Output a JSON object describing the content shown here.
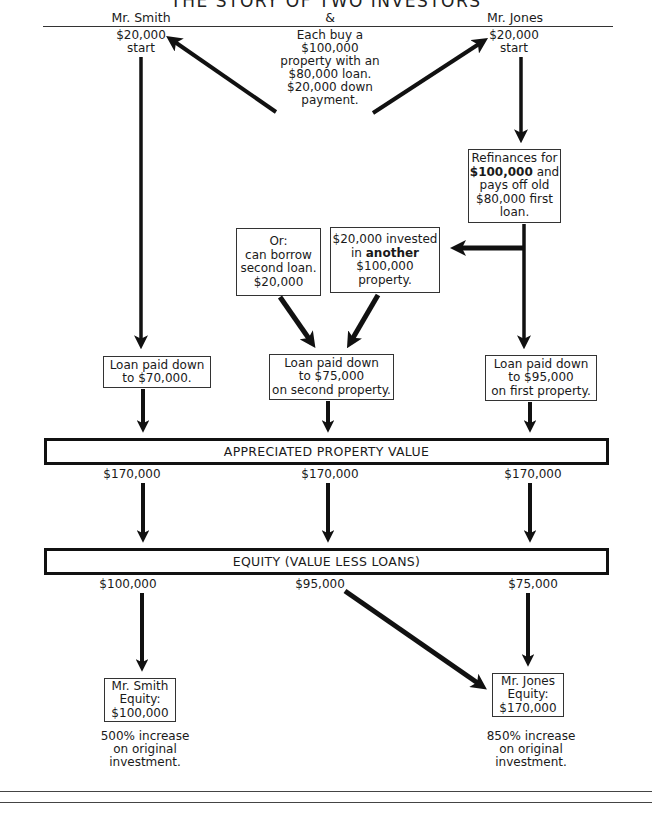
{
  "title": "THE STORY OF TWO INVESTORS",
  "header": {
    "left": "Mr. Smith",
    "middle": "&",
    "right": "Mr. Jones"
  },
  "smith": {
    "start_amount": "$20,000",
    "start_label": "start",
    "loan_box": [
      "Loan paid down",
      "to $70,000."
    ],
    "appreciated_value": "$170,000",
    "equity_value": "$100,000",
    "final_box": [
      "Mr. Smith",
      "Equity:",
      "$100,000"
    ],
    "increase_text": [
      "500% increase",
      "on original",
      "investment."
    ]
  },
  "middle": {
    "intro": [
      "Each buy a",
      "$100,000",
      "property with an",
      "$80,000 loan.",
      "$20,000 down",
      "payment."
    ],
    "borrow_box": [
      "Or:",
      "can borrow",
      "second loan.",
      "$20,000"
    ],
    "invested_box": {
      "line1": "$20,000 invested",
      "line2_prefix": "in ",
      "line2_bold": "another",
      "line3": "$100,000",
      "line4": "property."
    },
    "loan_box": [
      "Loan paid down",
      "to $75,000",
      "on second property."
    ],
    "appreciated_value": "$170,000",
    "equity_value": "$95,000"
  },
  "jones": {
    "start_amount": "$20,000",
    "start_label": "start",
    "refinance_box": {
      "line1": "Refinances for",
      "line2_bold": "$100,000",
      "line2_suffix": " and",
      "line3": "pays off old",
      "line4": "$80,000 first",
      "line5": "loan."
    },
    "loan_box": [
      "Loan paid down",
      "to $95,000",
      "on first property."
    ],
    "appreciated_value": "$170,000",
    "equity_value": "$75,000",
    "final_box": [
      "Mr. Jones",
      "Equity:",
      "$170,000"
    ],
    "increase_text": [
      "850% increase",
      "on original",
      "investment."
    ]
  },
  "bars": {
    "appreciated": "APPRECIATED PROPERTY VALUE",
    "equity": "EQUITY (VALUE LESS LOANS)"
  },
  "colors": {
    "ink": "#111111",
    "paper": "#ffffff"
  }
}
